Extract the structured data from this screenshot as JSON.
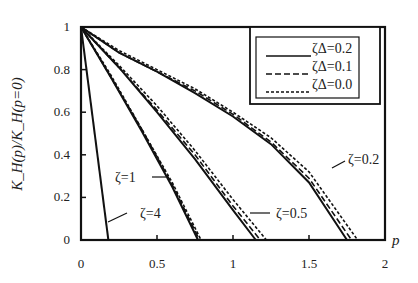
{
  "chart_data": {
    "type": "line",
    "title": "",
    "xlabel": "p",
    "ylabel": "K_H(p)/K_H(p=0)",
    "xlim": [
      0,
      2
    ],
    "ylim": [
      0,
      1
    ],
    "xticks": [
      "0",
      "0.5",
      "1",
      "1.5",
      "2"
    ],
    "yticks": [
      "0",
      "0.2",
      "0.4",
      "0.6",
      "0.8",
      "1"
    ],
    "grid": false,
    "legend_position": "upper right",
    "legend": [
      {
        "label": "ζΔ=0.2",
        "style": "solid"
      },
      {
        "label": "ζΔ=0.1",
        "style": "dashed"
      },
      {
        "label": "ζΔ=0.0",
        "style": "dotted"
      }
    ],
    "annotations": [
      {
        "text": "ζ=0.2",
        "x": 1.55,
        "y": 0.5
      },
      {
        "text": "ζ=0.5",
        "x": 1.25,
        "y": 0.07
      },
      {
        "text": "ζ=1",
        "x": 0.35,
        "y": 0.43
      },
      {
        "text": "ζ=4",
        "x": 0.36,
        "y": 0.15
      }
    ],
    "series": [
      {
        "name": "ζ=0.2, ζΔ=0.2",
        "style": "solid",
        "x": [
          0,
          0.25,
          0.5,
          0.75,
          1.0,
          1.25,
          1.5,
          1.75
        ],
        "y": [
          1,
          0.88,
          0.79,
          0.69,
          0.58,
          0.45,
          0.27,
          0.0
        ]
      },
      {
        "name": "ζ=0.2, ζΔ=0.1",
        "style": "dashed",
        "x": [
          0,
          0.25,
          0.5,
          0.75,
          1.0,
          1.25,
          1.5,
          1.78
        ],
        "y": [
          1,
          0.88,
          0.79,
          0.7,
          0.59,
          0.46,
          0.29,
          0.0
        ]
      },
      {
        "name": "ζ=0.2, ζΔ=0.0",
        "style": "dotted",
        "x": [
          0,
          0.25,
          0.5,
          0.75,
          1.0,
          1.25,
          1.5,
          1.82
        ],
        "y": [
          1,
          0.89,
          0.8,
          0.71,
          0.6,
          0.48,
          0.32,
          0.0
        ]
      },
      {
        "name": "ζ=0.5, ζΔ=0.2",
        "style": "solid",
        "x": [
          0,
          0.25,
          0.5,
          0.75,
          1.0,
          1.15
        ],
        "y": [
          1,
          0.81,
          0.6,
          0.38,
          0.14,
          0.0
        ]
      },
      {
        "name": "ζ=0.5, ζΔ=0.1",
        "style": "dashed",
        "x": [
          0,
          0.25,
          0.5,
          0.75,
          1.0,
          1.18
        ],
        "y": [
          1,
          0.81,
          0.61,
          0.4,
          0.16,
          0.0
        ]
      },
      {
        "name": "ζ=0.5, ζΔ=0.0",
        "style": "dotted",
        "x": [
          0,
          0.25,
          0.5,
          0.75,
          1.0,
          1.22
        ],
        "y": [
          1,
          0.82,
          0.63,
          0.42,
          0.19,
          0.0
        ]
      },
      {
        "name": "ζ=1, ζΔ=0.2",
        "style": "solid",
        "x": [
          0,
          0.2,
          0.4,
          0.6,
          0.77
        ],
        "y": [
          1,
          0.76,
          0.51,
          0.25,
          0.0
        ]
      },
      {
        "name": "ζ=1, ζΔ=0.1",
        "style": "dashed",
        "x": [
          0,
          0.2,
          0.4,
          0.6,
          0.78
        ],
        "y": [
          1,
          0.76,
          0.52,
          0.26,
          0.0
        ]
      },
      {
        "name": "ζ=1, ζΔ=0.0",
        "style": "dotted",
        "x": [
          0,
          0.2,
          0.4,
          0.6,
          0.79
        ],
        "y": [
          1,
          0.77,
          0.52,
          0.27,
          0.0
        ]
      },
      {
        "name": "ζ=4",
        "style": "solid",
        "x": [
          0,
          0.18
        ],
        "y": [
          1,
          0.0
        ]
      }
    ]
  }
}
